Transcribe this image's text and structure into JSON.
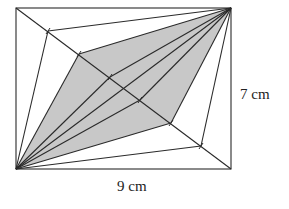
{
  "diagram": {
    "labels": {
      "height": "7 cm",
      "width": "9 cm"
    },
    "rectangle": {
      "x": 16,
      "y": 8,
      "w": 215,
      "h": 161
    },
    "diagonal_points": [
      [
        48,
        31
      ],
      [
        79,
        54
      ],
      [
        110,
        77
      ],
      [
        140,
        100
      ],
      [
        171,
        123
      ],
      [
        201,
        146
      ]
    ],
    "shaded_polygon": [
      [
        16,
        169
      ],
      [
        79,
        54
      ],
      [
        231,
        8
      ],
      [
        171,
        123
      ]
    ],
    "colors": {
      "stroke": "#2a2a2a",
      "shade": "#c8c8c8",
      "background": "#ffffff"
    }
  }
}
